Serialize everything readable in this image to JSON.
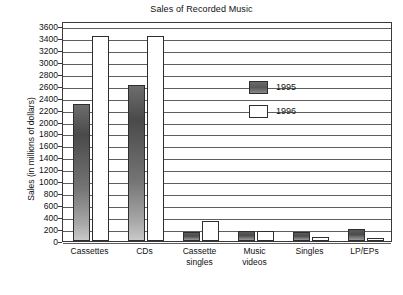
{
  "chart_data": {
    "type": "bar",
    "title": "Sales of Recorded Music",
    "xlabel": "",
    "ylabel": "Sales (in millions of dollars)",
    "ylim": [
      0,
      3700
    ],
    "yticks": [
      0,
      200,
      400,
      600,
      800,
      1000,
      1200,
      1400,
      1600,
      1800,
      2000,
      2200,
      2400,
      2600,
      2800,
      3000,
      3200,
      3400,
      3600
    ],
    "grid": true,
    "legend_position": "upper-center",
    "categories": [
      "Cassettes",
      "CDs",
      "Cassette singles",
      "Music videos",
      "Singles",
      "LP/EPs"
    ],
    "category_lines": [
      [
        "Cassettes"
      ],
      [
        "CDs"
      ],
      [
        "Cassette",
        "singles"
      ],
      [
        "Music",
        "videos"
      ],
      [
        "Singles"
      ],
      [
        "LP/EPs"
      ]
    ],
    "series": [
      {
        "name": "1995",
        "color": "#585858",
        "values": [
          2300,
          2625,
          150,
          165,
          150,
          200
        ]
      },
      {
        "name": "1996",
        "color": "#ffffff",
        "values": [
          3450,
          3450,
          330,
          175,
          75,
          50
        ]
      }
    ]
  },
  "legend": {
    "items": [
      {
        "label": "1995",
        "swatch": "swatch-1995"
      },
      {
        "label": "1996",
        "swatch": "swatch-1996"
      }
    ]
  }
}
